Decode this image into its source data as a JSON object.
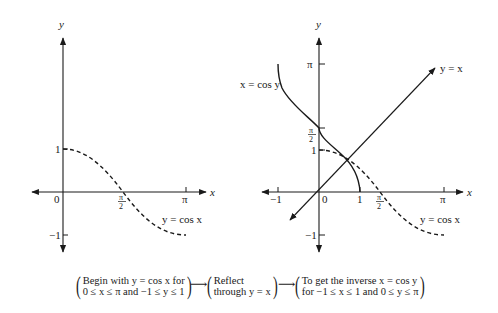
{
  "left_graph": {
    "axis_labels": {
      "x": "x",
      "y": "y"
    },
    "ticks": {
      "x": [
        "0",
        "π",
        "2",
        "π"
      ],
      "origin": "0",
      "y_pos": "1",
      "y_neg": "−1"
    },
    "x_tick_labels": {
      "half_pi_num": "π",
      "half_pi_den": "2",
      "pi": "π"
    },
    "curve_label": "y = cos x",
    "curve_style": "dashed"
  },
  "right_graph": {
    "axis_labels": {
      "x": "x",
      "y": "y"
    },
    "origin": "0",
    "x_tick_labels": {
      "neg_one": "−1",
      "one": "1",
      "half_pi_num": "π",
      "half_pi_den": "2",
      "pi": "π"
    },
    "y_tick_labels": {
      "pi": "π",
      "half_pi_num": "π",
      "half_pi_den": "2",
      "one": "1",
      "neg_one": "−1"
    },
    "line_label": "y = x",
    "inverse_label": "x = cos y",
    "cos_label": "y = cos x"
  },
  "caption": {
    "step1_line1": "Begin with y = cos x for",
    "step1_line2": "0 ≤ x ≤ π and −1 ≤ y ≤ 1",
    "arrow": "⟶",
    "step2_line1": "Reflect",
    "step2_line2": "through y = x",
    "step3_line1": "To get the inverse x = cos y",
    "step3_line2": "for −1 ≤ x ≤ 1 and 0 ≤ y ≤ π"
  }
}
